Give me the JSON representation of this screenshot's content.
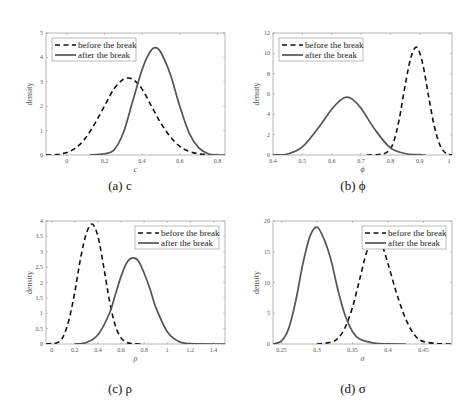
{
  "legend": {
    "before": "before the break",
    "after": "after the break"
  },
  "ylabel": "density",
  "chart_data": [
    {
      "type": "line",
      "caption": "(a) c",
      "xlabel": "c",
      "ylabel": "density",
      "xlim": [
        -0.11,
        0.84
      ],
      "ylim": [
        0,
        5
      ],
      "xticks": [
        0,
        0.2,
        0.4,
        0.6,
        0.8
      ],
      "yticks": [
        0,
        1,
        2,
        3,
        4,
        5
      ],
      "legend_position": "upper left",
      "series": [
        {
          "name": "before the break",
          "style": "dashed",
          "x": [
            -0.11,
            -0.05,
            0,
            0.05,
            0.1,
            0.15,
            0.2,
            0.25,
            0.3,
            0.33,
            0.36,
            0.4,
            0.45,
            0.5,
            0.55,
            0.6,
            0.65,
            0.7,
            0.75,
            0.8
          ],
          "y": [
            0.0,
            0.02,
            0.1,
            0.3,
            0.7,
            1.3,
            2.0,
            2.7,
            3.1,
            3.15,
            3.05,
            2.7,
            2.0,
            1.3,
            0.75,
            0.35,
            0.15,
            0.05,
            0.01,
            0.0
          ]
        },
        {
          "name": "after the break",
          "style": "solid",
          "x": [
            0.12,
            0.2,
            0.25,
            0.3,
            0.35,
            0.4,
            0.44,
            0.47,
            0.5,
            0.55,
            0.6,
            0.65,
            0.7,
            0.75,
            0.8,
            0.84
          ],
          "y": [
            0.0,
            0.05,
            0.2,
            0.9,
            2.2,
            3.5,
            4.2,
            4.4,
            4.2,
            3.3,
            2.0,
            0.9,
            0.3,
            0.05,
            0.0,
            0.0
          ]
        }
      ]
    },
    {
      "type": "line",
      "caption": "(b) ϕ",
      "xlabel": "ϕ",
      "ylabel": "density",
      "xlim": [
        0.4,
        1.01
      ],
      "ylim": [
        0,
        12
      ],
      "xticks": [
        0.4,
        0.5,
        0.6,
        0.7,
        0.8,
        0.9,
        1
      ],
      "yticks": [
        0,
        2,
        4,
        6,
        8,
        10,
        12
      ],
      "legend_position": "upper left",
      "series": [
        {
          "name": "before the break",
          "style": "dashed",
          "x": [
            0.72,
            0.76,
            0.79,
            0.81,
            0.83,
            0.85,
            0.87,
            0.89,
            0.91,
            0.93,
            0.95,
            0.97,
            0.99,
            1.01
          ],
          "y": [
            0.0,
            0.05,
            0.3,
            1.2,
            3.5,
            6.8,
            9.6,
            10.6,
            9.0,
            5.8,
            2.8,
            0.9,
            0.15,
            0.0
          ]
        },
        {
          "name": "after the break",
          "style": "solid",
          "x": [
            0.4,
            0.45,
            0.5,
            0.55,
            0.6,
            0.63,
            0.65,
            0.67,
            0.7,
            0.75,
            0.8,
            0.85,
            0.9,
            0.92
          ],
          "y": [
            0.0,
            0.1,
            0.8,
            2.5,
            4.5,
            5.4,
            5.7,
            5.5,
            4.6,
            2.4,
            0.7,
            0.15,
            0.02,
            0.0
          ]
        }
      ]
    },
    {
      "type": "line",
      "caption": "(c) ρ",
      "xlabel": "ρ",
      "ylabel": "density",
      "xlim": [
        -0.05,
        1.5
      ],
      "ylim": [
        0,
        4
      ],
      "xticks": [
        0,
        0.2,
        0.4,
        0.6,
        0.8,
        1,
        1.2,
        1.4
      ],
      "yticks": [
        0,
        0.5,
        1,
        1.5,
        2,
        2.5,
        3,
        3.5,
        4
      ],
      "legend_position": "upper right",
      "series": [
        {
          "name": "before the break",
          "style": "dashed",
          "x": [
            -0.05,
            0.05,
            0.1,
            0.15,
            0.2,
            0.25,
            0.3,
            0.35,
            0.4,
            0.45,
            0.5,
            0.55,
            0.6,
            0.65,
            0.7,
            0.78
          ],
          "y": [
            0.0,
            0.05,
            0.25,
            0.8,
            1.7,
            2.8,
            3.6,
            3.9,
            3.5,
            2.5,
            1.4,
            0.6,
            0.2,
            0.05,
            0.01,
            0.0
          ]
        },
        {
          "name": "after the break",
          "style": "solid",
          "x": [
            0.2,
            0.3,
            0.4,
            0.5,
            0.55,
            0.6,
            0.65,
            0.7,
            0.75,
            0.8,
            0.85,
            0.9,
            1.0,
            1.1,
            1.2,
            1.5
          ],
          "y": [
            0.0,
            0.05,
            0.3,
            1.0,
            1.6,
            2.2,
            2.65,
            2.8,
            2.7,
            2.3,
            1.8,
            1.2,
            0.4,
            0.08,
            0.01,
            0.0
          ]
        }
      ]
    },
    {
      "type": "line",
      "caption": "(d) σ",
      "xlabel": "σ",
      "ylabel": "density",
      "xlim": [
        0.238,
        0.49
      ],
      "ylim": [
        0,
        20
      ],
      "xticks": [
        0.25,
        0.3,
        0.35,
        0.4,
        0.45
      ],
      "yticks": [
        0,
        5,
        10,
        15,
        20
      ],
      "legend_position": "upper right",
      "series": [
        {
          "name": "before the break",
          "style": "dashed",
          "x": [
            0.3,
            0.32,
            0.33,
            0.34,
            0.35,
            0.36,
            0.37,
            0.38,
            0.39,
            0.4,
            0.41,
            0.42,
            0.43,
            0.44,
            0.45,
            0.47,
            0.49
          ],
          "y": [
            0.0,
            0.3,
            1.0,
            2.8,
            6.0,
            10.5,
            15.0,
            17.3,
            16.5,
            13.0,
            9.0,
            5.5,
            2.8,
            1.1,
            0.4,
            0.05,
            0.0
          ]
        },
        {
          "name": "after the break",
          "style": "solid",
          "x": [
            0.238,
            0.25,
            0.26,
            0.27,
            0.28,
            0.29,
            0.3,
            0.31,
            0.32,
            0.33,
            0.34,
            0.35,
            0.36,
            0.38,
            0.4,
            0.425
          ],
          "y": [
            0.0,
            0.5,
            2.5,
            7.0,
            13.0,
            17.5,
            19.0,
            17.0,
            13.5,
            8.5,
            4.5,
            2.0,
            0.8,
            0.15,
            0.02,
            0.0
          ]
        }
      ]
    }
  ]
}
